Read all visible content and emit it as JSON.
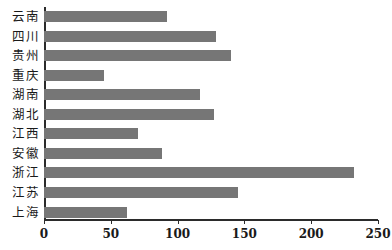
{
  "chart_data": {
    "type": "bar",
    "orientation": "horizontal",
    "title": "",
    "subtitle": "",
    "xlabel": "",
    "ylabel": "",
    "categories": [
      "云南",
      "四川",
      "贵州",
      "重庆",
      "湖南",
      "湖北",
      "江西",
      "安徽",
      "浙江",
      "江苏",
      "上海"
    ],
    "values": [
      92,
      129,
      140,
      45,
      117,
      127,
      70,
      88,
      232,
      145,
      62
    ],
    "xticks": [
      0,
      50,
      100,
      150,
      200,
      250
    ],
    "xtick_labels": [
      "0",
      "50",
      "100",
      "150",
      "200",
      "250"
    ],
    "xlim": [
      0,
      250
    ],
    "grid": false,
    "legend": null,
    "legend_position": "none",
    "bar_color": "#767676",
    "axis_color": "#2b2b2b",
    "background_color": "#ffffff",
    "annotations": []
  }
}
